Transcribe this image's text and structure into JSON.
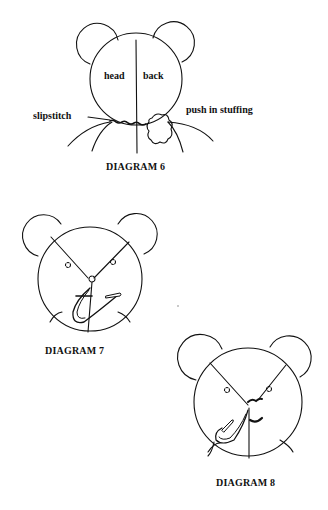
{
  "diagrams": [
    {
      "id": 6,
      "caption": "DIAGRAM 6",
      "labels": {
        "left_half": "head",
        "right_half": "back",
        "callout_left": "slipstitch",
        "callout_right": "push in stuffing"
      }
    },
    {
      "id": 7,
      "caption": "DIAGRAM 7"
    },
    {
      "id": 8,
      "caption": "DIAGRAM 8"
    }
  ],
  "colors": {
    "ink": "#111111",
    "paper": "#ffffff"
  }
}
